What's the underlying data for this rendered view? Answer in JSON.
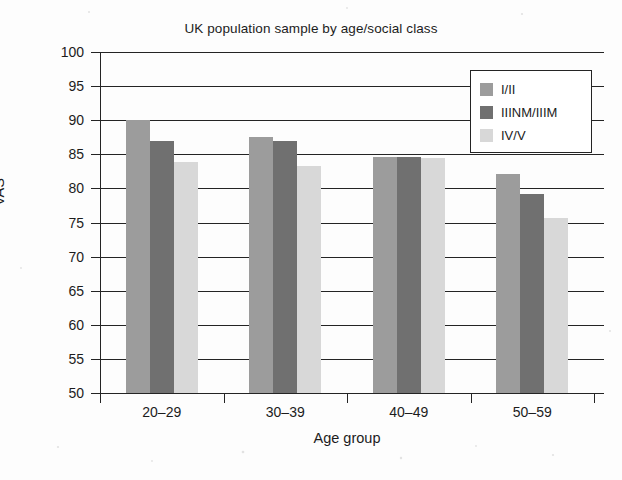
{
  "chart_data": {
    "type": "bar",
    "title": "UK population sample by age/social class",
    "xlabel": "Age group",
    "ylabel": "VAS",
    "categories": [
      "20–29",
      "30–39",
      "40–49",
      "50–59"
    ],
    "series": [
      {
        "name": "I/II",
        "color": "#9c9c9c",
        "values": [
          90.0,
          87.6,
          84.6,
          82.1
        ]
      },
      {
        "name": "IIINM/IIIM",
        "color": "#707070",
        "values": [
          87.0,
          87.0,
          84.6,
          79.2
        ]
      },
      {
        "name": "IV/V",
        "color": "#d8d8d8",
        "values": [
          83.9,
          83.3,
          84.5,
          75.7
        ]
      }
    ],
    "ylim": [
      50,
      100
    ],
    "yticks": [
      50,
      55,
      60,
      65,
      70,
      75,
      80,
      85,
      90,
      95,
      100
    ],
    "ytick_labels": [
      "50",
      "55",
      "60",
      "65",
      "70",
      "75",
      "80",
      "85",
      "90",
      "95",
      "100"
    ],
    "grid": true,
    "grid_axis": "y",
    "legend_position": "top-right",
    "legend_entries": [
      "I/II",
      "IIINM/IIIM",
      "IV/V"
    ]
  },
  "figure": {
    "background_color": "#fdfdfd",
    "axis_color": "#242424"
  }
}
